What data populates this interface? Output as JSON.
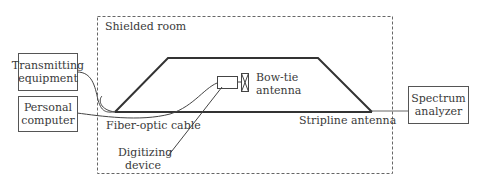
{
  "diagram": {
    "room_label": "Shielded room",
    "boxes": {
      "transmitting": [
        "Transmitting",
        "equipment"
      ],
      "computer": [
        "Personal",
        "computer"
      ],
      "analyzer": [
        "Spectrum",
        "analyzer"
      ]
    },
    "labels": {
      "bowtie": [
        "Bow-tie",
        "antenna"
      ],
      "fiber": "Fiber-optic cable",
      "stripline": "Stripline antenna",
      "digitizing": [
        "Digitizing",
        "device"
      ]
    }
  }
}
